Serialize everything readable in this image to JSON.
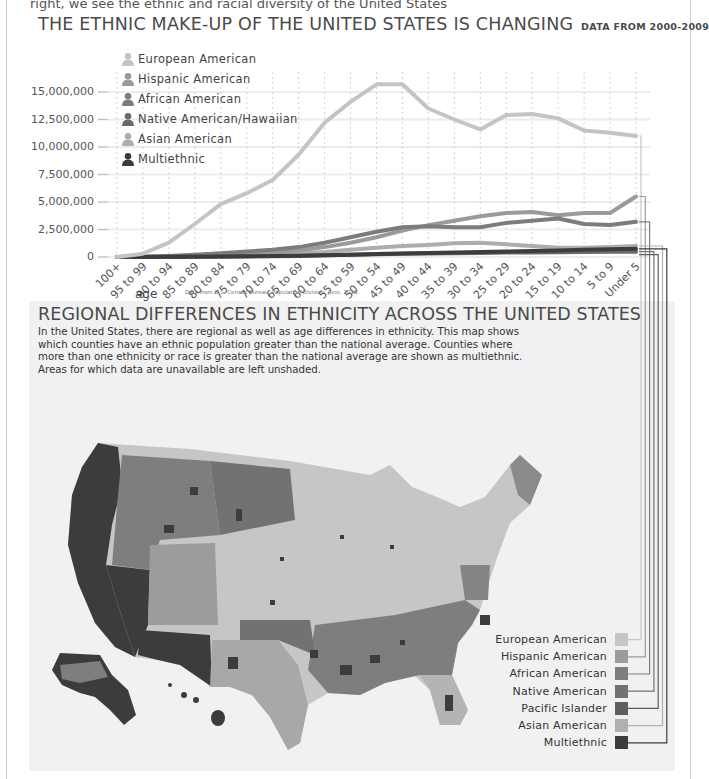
{
  "page": {
    "top_fragment": "right, we see the ethnic and racial diversity of the United States"
  },
  "chart": {
    "title": "THE ETHNIC MAKE-UP OF THE UNITED STATES IS CHANGING",
    "subtitle": "DATA FROM 2000-2009",
    "legend": [
      {
        "label": "European American",
        "color": "#c4c4c4"
      },
      {
        "label": "Hispanic American",
        "color": "#9a9a9a"
      },
      {
        "label": "African American",
        "color": "#7c7c7c"
      },
      {
        "label": "Native American/Hawaiian",
        "color": "#6a6a6a"
      },
      {
        "label": "Asian American",
        "color": "#adadad"
      },
      {
        "label": "Multiethnic",
        "color": "#3d3d3d"
      }
    ],
    "y_ticks": [
      "15,000,000",
      "12,500,000",
      "10,000,000",
      "7,500,000",
      "5,000,000",
      "2,500,000",
      "0"
    ],
    "x_title": "age",
    "source": "Data from U.S. Census Bureau, Population Division, June, 2010."
  },
  "chart_data": {
    "type": "line",
    "title": "THE ETHNIC MAKE-UP OF THE UNITED STATES IS CHANGING",
    "subtitle": "DATA FROM 2000-2009",
    "xlabel": "age",
    "ylabel": "",
    "ylim": [
      0,
      16000000
    ],
    "grid": true,
    "legend_position": "top-left",
    "categories": [
      "100+",
      "95 to 99",
      "90 to 94",
      "85 to 89",
      "80 to 84",
      "75 to 79",
      "70 to 74",
      "65 to 69",
      "60 to 64",
      "55 to 59",
      "50 to 54",
      "45 to 49",
      "40 to 44",
      "35 to 39",
      "30 to 34",
      "25 to 29",
      "20 to 24",
      "15 to 19",
      "10 to 14",
      "5 to 9",
      "Under 5"
    ],
    "series": [
      {
        "name": "European American",
        "values": [
          0,
          300000,
          1300000,
          3000000,
          4800000,
          5800000,
          7000000,
          9300000,
          12200000,
          14100000,
          15700000,
          15700000,
          13500000,
          12500000,
          11600000,
          12900000,
          13000000,
          12600000,
          11500000,
          11300000,
          11000000
        ]
      },
      {
        "name": "Hispanic American",
        "values": [
          0,
          20000,
          60000,
          120000,
          200000,
          300000,
          400000,
          600000,
          900000,
          1300000,
          1800000,
          2400000,
          2900000,
          3300000,
          3700000,
          4000000,
          4100000,
          3800000,
          4000000,
          4000000,
          5500000
        ]
      },
      {
        "name": "African American",
        "values": [
          0,
          30000,
          100000,
          200000,
          350000,
          500000,
          650000,
          900000,
          1300000,
          1800000,
          2300000,
          2700000,
          2800000,
          2700000,
          2700000,
          3100000,
          3300000,
          3500000,
          3000000,
          2900000,
          3200000
        ]
      },
      {
        "name": "Native American/Hawaiian",
        "values": [
          0,
          5000,
          10000,
          20000,
          30000,
          50000,
          70000,
          100000,
          150000,
          200000,
          250000,
          300000,
          330000,
          350000,
          370000,
          400000,
          420000,
          440000,
          460000,
          470000,
          480000
        ]
      },
      {
        "name": "Asian American",
        "values": [
          0,
          10000,
          30000,
          60000,
          100000,
          150000,
          200000,
          300000,
          450000,
          650000,
          850000,
          1000000,
          1100000,
          1250000,
          1300000,
          1150000,
          1000000,
          850000,
          850000,
          900000,
          1000000
        ]
      },
      {
        "name": "Multiethnic",
        "values": [
          0,
          5000,
          15000,
          30000,
          50000,
          70000,
          90000,
          120000,
          160000,
          210000,
          260000,
          310000,
          360000,
          400000,
          450000,
          500000,
          550000,
          600000,
          650000,
          700000,
          750000
        ]
      }
    ]
  },
  "map": {
    "title": "REGIONAL DIFFERENCES IN ETHNICITY ACROSS THE UNITED STATES",
    "description": "In the United States, there are regional as well as age differences in ethnicity. This map shows which counties have an ethnic population greater than the national average. Counties where more than one ethnicity or race is greater than the national average are shown as multiethnic. Areas for which data are unavailable are left unshaded.",
    "legend": [
      {
        "label": "European American",
        "color": "#c6c6c6"
      },
      {
        "label": "Hispanic American",
        "color": "#9c9c9c"
      },
      {
        "label": "African American",
        "color": "#7e7e7e"
      },
      {
        "label": "Native American",
        "color": "#727272"
      },
      {
        "label": "Pacific Islander",
        "color": "#5e5e5e"
      },
      {
        "label": "Asian American",
        "color": "#b0b0b0"
      },
      {
        "label": "Multiethnic",
        "color": "#3c3c3c"
      }
    ]
  }
}
